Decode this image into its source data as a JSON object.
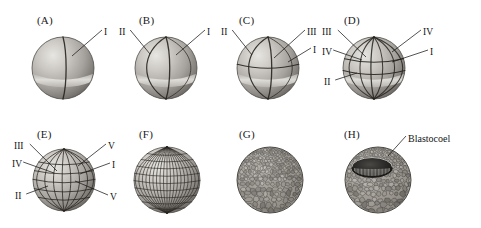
{
  "figure": {
    "background_color": "#ffffff",
    "ink_color": "#141414",
    "width": 481,
    "height": 228,
    "rows": 2,
    "columns": 4
  },
  "panels": [
    {
      "id": "A",
      "letter": "(A)",
      "letter_x": 37,
      "letter_y": 14,
      "center_x": 63,
      "center_y": 68,
      "radius": 31,
      "type": "two-cell",
      "description": "Embryo after first cleavage, single vertical furrow with light equatorial band",
      "labels": [
        {
          "text": "I",
          "x": 104,
          "y": 27,
          "anchor_x": 72,
          "anchor_y": 56,
          "side": "right"
        }
      ]
    },
    {
      "id": "B",
      "letter": "(B)",
      "letter_x": 139,
      "letter_y": 14,
      "center_x": 166,
      "center_y": 68,
      "radius": 31,
      "type": "four-cell",
      "description": "Embryo after second cleavage, two perpendicular vertical furrows",
      "labels": [
        {
          "text": "II",
          "x": 119,
          "y": 27,
          "anchor_x": 150,
          "anchor_y": 54,
          "side": "left"
        },
        {
          "text": "I",
          "x": 207,
          "y": 27,
          "anchor_x": 176,
          "anchor_y": 55,
          "side": "right"
        }
      ]
    },
    {
      "id": "C",
      "letter": "(C)",
      "letter_x": 239,
      "letter_y": 14,
      "center_x": 268,
      "center_y": 68,
      "radius": 31,
      "type": "eight-cell",
      "description": "Embryo after third cleavage, equatorial furrow added above the light band",
      "labels": [
        {
          "text": "II",
          "x": 221,
          "y": 27,
          "anchor_x": 252,
          "anchor_y": 55,
          "side": "left"
        },
        {
          "text": "III",
          "x": 307,
          "y": 27,
          "anchor_x": 274,
          "anchor_y": 58,
          "side": "right"
        },
        {
          "text": "I",
          "x": 313,
          "y": 45,
          "anchor_x": 288,
          "anchor_y": 62,
          "side": "right"
        }
      ]
    },
    {
      "id": "D",
      "letter": "(D)",
      "letter_x": 344,
      "letter_y": 14,
      "center_x": 374,
      "center_y": 68,
      "radius": 31,
      "type": "sixteen-cell",
      "description": "Embryo after fourth cleavage, several meridional furrows and two latitudinal furrows",
      "labels": [
        {
          "text": "III",
          "x": 322,
          "y": 27,
          "anchor_x": 366,
          "anchor_y": 57,
          "side": "left"
        },
        {
          "text": "IV",
          "x": 322,
          "y": 47,
          "anchor_x": 362,
          "anchor_y": 60,
          "side": "left"
        },
        {
          "text": "II",
          "x": 324,
          "y": 77,
          "anchor_x": 357,
          "anchor_y": 73,
          "side": "left"
        },
        {
          "text": "IV",
          "x": 423,
          "y": 27,
          "anchor_x": 392,
          "anchor_y": 52,
          "side": "right"
        },
        {
          "text": "I",
          "x": 430,
          "y": 47,
          "anchor_x": 392,
          "anchor_y": 62,
          "side": "right"
        }
      ]
    },
    {
      "id": "E",
      "letter": "(E)",
      "letter_x": 37,
      "letter_y": 128,
      "center_x": 64,
      "center_y": 180,
      "radius": 31,
      "type": "thirty-two-cell",
      "description": "Embryo after fifth cleavage, dense grid of meridional and latitudinal furrows",
      "labels": [
        {
          "text": "III",
          "x": 14,
          "y": 141,
          "anchor_x": 57,
          "anchor_y": 171,
          "side": "left"
        },
        {
          "text": "IV",
          "x": 12,
          "y": 159,
          "anchor_x": 54,
          "anchor_y": 173,
          "side": "left"
        },
        {
          "text": "II",
          "x": 15,
          "y": 191,
          "anchor_x": 48,
          "anchor_y": 186,
          "side": "left"
        },
        {
          "text": "V",
          "x": 108,
          "y": 141,
          "anchor_x": 78,
          "anchor_y": 166,
          "side": "right"
        },
        {
          "text": "I",
          "x": 112,
          "y": 160,
          "anchor_x": 80,
          "anchor_y": 174,
          "side": "right"
        },
        {
          "text": "V",
          "x": 110,
          "y": 192,
          "anchor_x": 75,
          "anchor_y": 181,
          "side": "right"
        }
      ]
    },
    {
      "id": "F",
      "letter": "(F)",
      "letter_x": 139,
      "letter_y": 128,
      "center_x": 167,
      "center_y": 180,
      "radius": 33,
      "type": "morula-grid",
      "description": "Embryo with regular globe-like grid of many blastomeres, no labels",
      "labels": []
    },
    {
      "id": "G",
      "letter": "(G)",
      "letter_x": 239,
      "letter_y": 128,
      "center_x": 270,
      "center_y": 180,
      "radius": 33,
      "type": "blastula-cells",
      "description": "Blastula surface composed of many small polygonal cells, smaller at the animal pole",
      "labels": []
    },
    {
      "id": "H",
      "letter": "(H)",
      "letter_x": 344,
      "letter_y": 128,
      "center_x": 378,
      "center_y": 180,
      "radius": 33,
      "type": "blastula-sectioned",
      "description": "Blastula cut open to reveal the internal cavity",
      "labels": [
        {
          "text": "Blastocoel",
          "x": 408,
          "y": 133,
          "anchor_x": 388,
          "anchor_y": 156,
          "side": "right"
        }
      ]
    }
  ]
}
